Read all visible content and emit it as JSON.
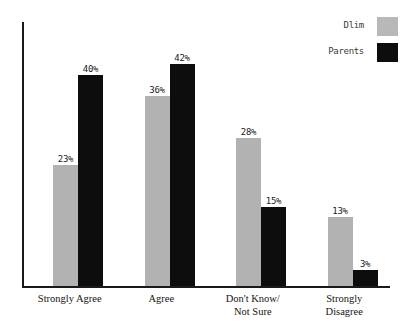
{
  "chart_data": {
    "type": "bar",
    "title": "",
    "subtitle": "",
    "xlabel": "",
    "ylabel": "",
    "grid": false,
    "legend_position": "top-right",
    "ylim": [
      0,
      50
    ],
    "categories": [
      "Strongly Agree",
      "Agree",
      "Don't Know/ Not Sure",
      "Strongly Disagree"
    ],
    "category_lines": [
      [
        "Strongly Agree"
      ],
      [
        "Agree"
      ],
      [
        "Don't Know/",
        "Not Sure"
      ],
      [
        "Strongly",
        "Disagree"
      ]
    ],
    "series": [
      {
        "name": "Dlim",
        "color": "#b2b2b2",
        "values": [
          23,
          36,
          28,
          13
        ],
        "labels": [
          "23%",
          "36%",
          "28%",
          "13%"
        ]
      },
      {
        "name": "Parents",
        "color": "#0d0d0d",
        "values": [
          40,
          42,
          15,
          3
        ],
        "labels": [
          "40%",
          "42%",
          "15%",
          "3%"
        ]
      }
    ]
  },
  "legend": {
    "entries": [
      {
        "label": "Dlim"
      },
      {
        "label": "Parents"
      }
    ]
  },
  "colors": {
    "series_0": "#b2b2b2",
    "series_1": "#0d0d0d",
    "axis": "#1a1a1a",
    "text": "#141414",
    "background": "#ffffff"
  }
}
